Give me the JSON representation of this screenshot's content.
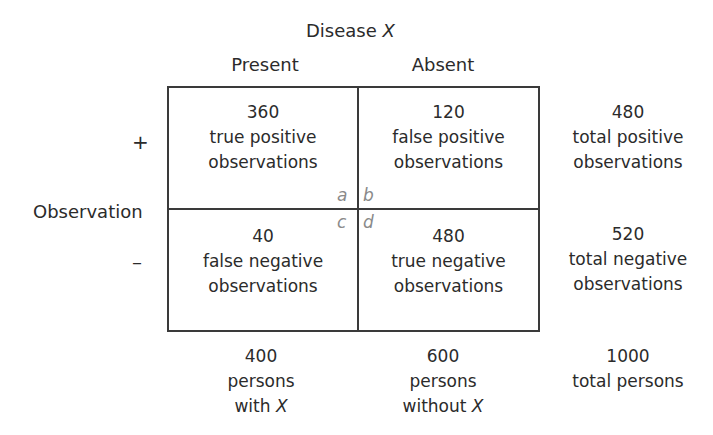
{
  "header": {
    "title_prefix": "Disease ",
    "title_var": "X",
    "col_present": "Present",
    "col_absent": "Absent"
  },
  "rows": {
    "axis_label": "Observation",
    "positive_sign": "+",
    "negative_sign": "–"
  },
  "cells": {
    "a": {
      "letter": "a",
      "count": "360",
      "line1": "true positive",
      "line2": "observations"
    },
    "b": {
      "letter": "b",
      "count": "120",
      "line1": "false positive",
      "line2": "observations"
    },
    "c": {
      "letter": "c",
      "count": "40",
      "line1": "false negative",
      "line2": "observations"
    },
    "d": {
      "letter": "d",
      "count": "480",
      "line1": "true negative",
      "line2": "observations"
    }
  },
  "row_totals": {
    "positive": {
      "count": "480",
      "line1": "total positive",
      "line2": "observations"
    },
    "negative": {
      "count": "520",
      "line1": "total negative",
      "line2": "observations"
    }
  },
  "col_totals": {
    "present": {
      "count": "400",
      "line1": "persons",
      "line2_prefix": "with ",
      "line2_var": "X"
    },
    "absent": {
      "count": "600",
      "line1": "persons",
      "line2_prefix": "without ",
      "line2_var": "X"
    },
    "grand": {
      "count": "1000",
      "line1": "total persons"
    }
  }
}
